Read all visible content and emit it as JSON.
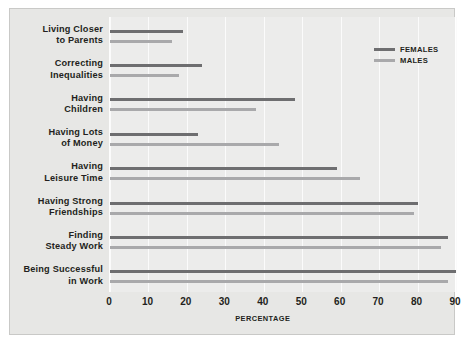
{
  "chart_data": {
    "type": "bar",
    "orientation": "horizontal",
    "title": "",
    "xlabel": "PERCENTAGE",
    "ylabel": "",
    "xlim": [
      0,
      90
    ],
    "xticks": [
      0,
      10,
      20,
      30,
      40,
      50,
      60,
      70,
      80,
      90
    ],
    "grid": true,
    "legend_position": "top-right",
    "categories": [
      "Living Closer to Parents",
      "Correcting Inequalities",
      "Having Children",
      "Having Lots of Money",
      "Having Leisure Time",
      "Having Strong Friendships",
      "Finding Steady Work",
      "Being Successful in Work"
    ],
    "category_lines": [
      [
        "Living Closer",
        "to Parents"
      ],
      [
        "Correcting",
        "Inequalities"
      ],
      [
        "Having",
        "Children"
      ],
      [
        "Having Lots",
        "of Money"
      ],
      [
        "Having",
        "Leisure Time"
      ],
      [
        "Having Strong",
        "Friendships"
      ],
      [
        "Finding",
        "Steady Work"
      ],
      [
        "Being Successful",
        "in Work"
      ]
    ],
    "series": [
      {
        "name": "FEMALES",
        "color": "#6e6e70",
        "values": [
          19,
          24,
          48,
          23,
          59,
          80,
          88,
          90
        ]
      },
      {
        "name": "MALES",
        "color": "#a9a9ab",
        "values": [
          16,
          18,
          38,
          44,
          65,
          79,
          86,
          88
        ]
      }
    ]
  },
  "legend": {
    "items": [
      {
        "label": "FEMALES"
      },
      {
        "label": "MALES"
      }
    ]
  },
  "colors": {
    "background": "#e7e7e5",
    "plot_background": "#ececeb",
    "gridline": "#fbfbfb",
    "text": "#231f20",
    "females": "#6e6e70",
    "males": "#a9a9ab"
  }
}
